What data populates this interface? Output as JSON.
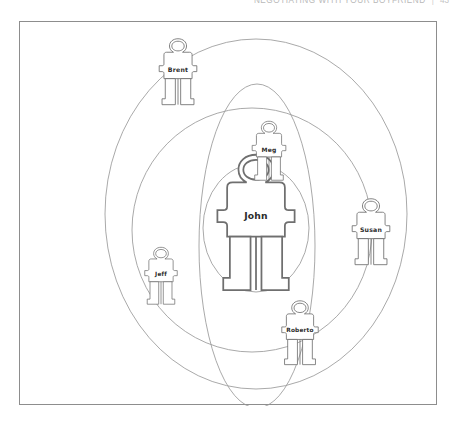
{
  "running_head": {
    "title": "NEGOTIATING WITH YOUR BOYFRIEND",
    "separator": "|",
    "page_number": "43"
  },
  "figure": {
    "caption": "",
    "frame_color": "#8d8d8d",
    "background_color": "#ffffff",
    "ring_color": "#9a9a9a"
  },
  "diagram": {
    "type": "relationship-spheres",
    "center_person": "John",
    "rings": [
      {
        "name": "outer-ring",
        "cx": 236,
        "cy": 192,
        "rx": 151,
        "ry": 175,
        "rotation": 0
      },
      {
        "name": "middle-ring",
        "cx": 232,
        "cy": 208,
        "rx": 120,
        "ry": 122,
        "rotation": 0
      },
      {
        "name": "vertical-ring",
        "cx": 237,
        "cy": 224,
        "rx": 58,
        "ry": 162,
        "rotation": 0
      },
      {
        "name": "inner-ring",
        "cx": 236,
        "cy": 206,
        "rx": 53,
        "ry": 64,
        "rotation": 0
      }
    ],
    "people": [
      {
        "name": "John",
        "x": 236,
        "y": 201,
        "scale": 1.95,
        "label_size": 9.2,
        "label_dy": 0
      },
      {
        "name": "Meg",
        "x": 249,
        "y": 129,
        "scale": 0.85,
        "label_size": 6.0,
        "label_dy": 0
      },
      {
        "name": "Jeff",
        "x": 141,
        "y": 254,
        "scale": 0.82,
        "label_size": 5.8,
        "label_dy": 0
      },
      {
        "name": "Roberto",
        "x": 280,
        "y": 311,
        "scale": 0.92,
        "label_size": 5.8,
        "label_dy": 0
      },
      {
        "name": "Susan",
        "x": 351,
        "y": 210,
        "scale": 0.95,
        "label_size": 6.2,
        "label_dy": 0
      },
      {
        "name": "Brent",
        "x": 158,
        "y": 50,
        "scale": 0.95,
        "label_size": 6.2,
        "label_dy": 0
      }
    ]
  }
}
